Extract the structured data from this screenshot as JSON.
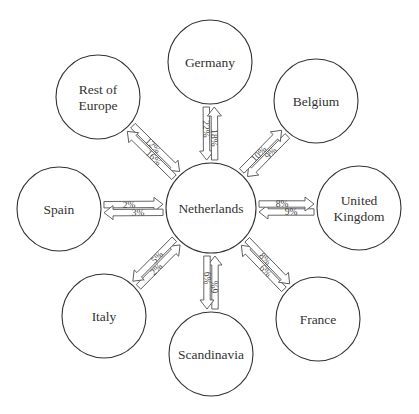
{
  "diagram": {
    "title": "",
    "hub": {
      "id": "netherlands",
      "label": [
        "Netherlands"
      ]
    },
    "partners": [
      {
        "id": "germany",
        "label": [
          "Germany"
        ],
        "to_hub_pct": "22%",
        "from_hub_pct": "18%"
      },
      {
        "id": "belgium",
        "label": [
          "Belgium"
        ],
        "to_hub_pct": "9%",
        "from_hub_pct": "10%"
      },
      {
        "id": "united-kingdom",
        "label": [
          "United",
          "Kingdom"
        ],
        "to_hub_pct": "9%",
        "from_hub_pct": "8%"
      },
      {
        "id": "france",
        "label": [
          "France"
        ],
        "to_hub_pct": "6%",
        "from_hub_pct": "8%"
      },
      {
        "id": "scandinavia",
        "label": [
          "Scandinavia"
        ],
        "to_hub_pct": "6%",
        "from_hub_pct": "6%"
      },
      {
        "id": "italy",
        "label": [
          "Italy"
        ],
        "to_hub_pct": "2%",
        "from_hub_pct": "5%"
      },
      {
        "id": "spain",
        "label": [
          "Spain"
        ],
        "to_hub_pct": "2%",
        "from_hub_pct": "3%"
      },
      {
        "id": "rest-of-europe",
        "label": [
          "Rest of",
          "Europe"
        ],
        "to_hub_pct": "12%",
        "from_hub_pct": "16%"
      }
    ]
  }
}
